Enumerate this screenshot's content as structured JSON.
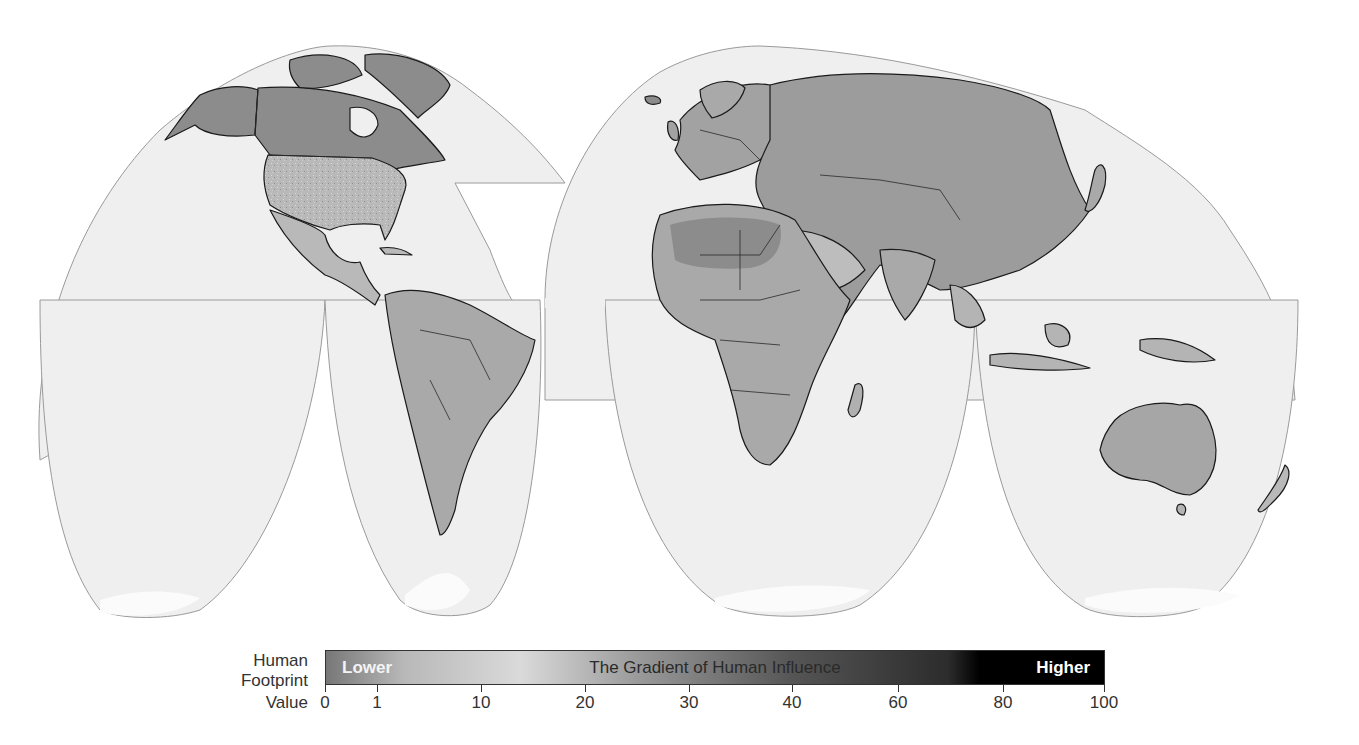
{
  "map": {
    "projection": "Interrupted Goode homolosine",
    "colors": {
      "ocean": "#efefef",
      "ocean_outline": "#9a9a9a",
      "land_low": "#c8c8c8",
      "land_mid": "#a9a9a9",
      "land_wild": "#8c8c8c",
      "coastline": "#1a1a1a",
      "antarctic_ice": "#fbfbfb"
    },
    "regions": [
      {
        "name": "North America",
        "shade": "mixed"
      },
      {
        "name": "Greenland",
        "shade": "land_wild"
      },
      {
        "name": "South America",
        "shade": "mixed"
      },
      {
        "name": "Europe",
        "shade": "land_mid"
      },
      {
        "name": "Africa",
        "shade": "mixed"
      },
      {
        "name": "Asia",
        "shade": "mixed"
      },
      {
        "name": "Australia",
        "shade": "mixed"
      },
      {
        "name": "New Zealand",
        "shade": "land_low"
      },
      {
        "name": "Antarctica",
        "shade": "antarctic_ice"
      }
    ]
  },
  "legend": {
    "label_lines": [
      "Human",
      "Footprint",
      "Value"
    ],
    "bar": {
      "lower_label": "Lower",
      "title": "The Gradient of Human Influence",
      "higher_label": "Higher",
      "gradient_stops": [
        {
          "value": 0,
          "color": "#777777"
        },
        {
          "value": 10,
          "color": "#b8b8b8"
        },
        {
          "value": 25,
          "color": "#dadada"
        },
        {
          "value": 40,
          "color": "#9a9a9a"
        },
        {
          "value": 60,
          "color": "#555555"
        },
        {
          "value": 80,
          "color": "#2c2c2c"
        },
        {
          "value": 84,
          "color": "#000000"
        },
        {
          "value": 100,
          "color": "#000000"
        }
      ]
    },
    "ticks": [
      {
        "label": "0",
        "x": 325
      },
      {
        "label": "1",
        "x": 377
      },
      {
        "label": "10",
        "x": 481
      },
      {
        "label": "20",
        "x": 585
      },
      {
        "label": "30",
        "x": 689
      },
      {
        "label": "40",
        "x": 792
      },
      {
        "label": "60",
        "x": 898
      },
      {
        "label": "80",
        "x": 1003
      },
      {
        "label": "100",
        "x": 1105
      }
    ]
  }
}
